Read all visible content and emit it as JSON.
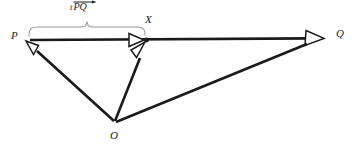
{
  "figure": {
    "type": "vector-geometry-diagram",
    "background_color": "#ffffff",
    "stroke_color": "#1a1a1a",
    "brace_color": "#9a9a9a",
    "points": [
      {
        "id": "P",
        "label": "P",
        "x": 28,
        "y": 40
      },
      {
        "id": "X",
        "label": "X",
        "x": 145,
        "y": 40
      },
      {
        "id": "Q",
        "label": "Q",
        "x": 322,
        "y": 38
      },
      {
        "id": "O",
        "label": "O",
        "x": 115,
        "y": 122
      }
    ],
    "vectors": [
      {
        "id": "OP",
        "label": "OP",
        "from": "O",
        "to": "P",
        "arrowhead": "open"
      },
      {
        "id": "OX",
        "label": "OX",
        "from": "O",
        "to": "X",
        "arrowhead": "open"
      },
      {
        "id": "OQ",
        "label": "OQ",
        "from": "O",
        "to": "Q",
        "arrowhead": "open"
      },
      {
        "id": "PX",
        "label": "PX",
        "from": "P",
        "to": "X",
        "arrowhead": "open"
      },
      {
        "id": "PQ",
        "label": "PQ",
        "from": "P",
        "to": "Q",
        "arrowhead": "open"
      }
    ],
    "brace": {
      "id": "brace-P-X",
      "spans_from": "P",
      "spans_to": "X",
      "label_text": "tPQ",
      "scalar": "t",
      "vector_name": "PQ",
      "has_vector_arrow": true
    },
    "marked_point": {
      "id": "X",
      "style": "filled-dot"
    }
  }
}
